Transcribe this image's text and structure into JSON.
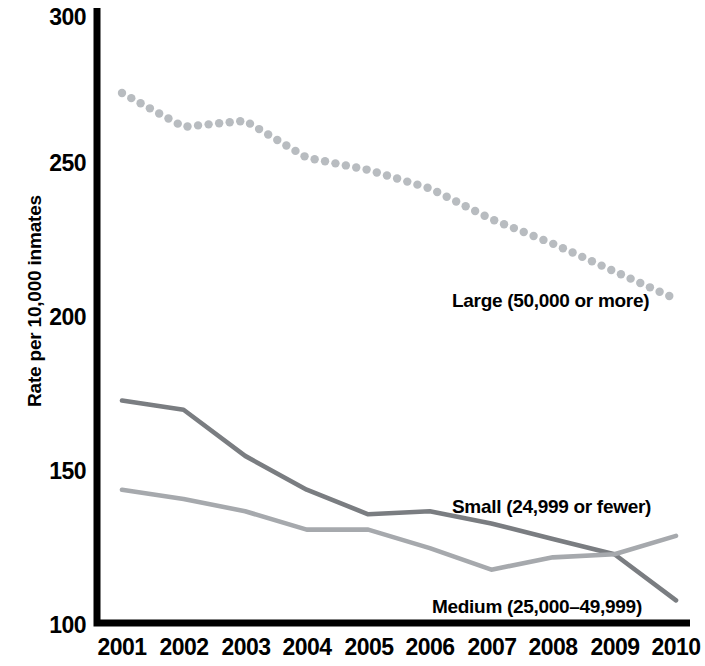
{
  "chart_data": {
    "type": "line",
    "title": "",
    "subtitle": "",
    "xlabel": "",
    "ylabel": "Rate per 10,000 inmates",
    "x": [
      2001,
      2002,
      2003,
      2004,
      2005,
      2006,
      2007,
      2008,
      2009,
      2010
    ],
    "categories": [
      "2001",
      "2002",
      "2003",
      "2004",
      "2005",
      "2006",
      "2007",
      "2008",
      "2009",
      "2010"
    ],
    "xlim": [
      2001,
      2010
    ],
    "ylim": [
      100,
      300
    ],
    "yticks": [
      100,
      150,
      200,
      250,
      300
    ],
    "ytick_labels": [
      "100",
      "150",
      "200",
      "250",
      "300"
    ],
    "grid": false,
    "legend_position": "inline-annotations",
    "series": [
      {
        "name": "Large (50,000 or more)",
        "style": "dotted",
        "color": "#b8bcc0",
        "values": [
          273,
          262,
          264,
          252,
          248,
          242,
          232,
          224,
          215,
          206
        ]
      },
      {
        "name": "Medium (25,000–49,999)",
        "style": "solid",
        "color": "#7a7d81",
        "values": [
          173,
          170,
          155,
          144,
          136,
          137,
          133,
          128,
          123,
          108
        ]
      },
      {
        "name": "Small (24,999 or fewer)",
        "style": "solid",
        "color": "#a6a9ad",
        "values": [
          144,
          141,
          137,
          131,
          131,
          125,
          118,
          122,
          123,
          129
        ]
      }
    ],
    "annotations": [
      {
        "text": "Large (50,000 or more)",
        "series": "Large (50,000 or more)"
      },
      {
        "text": "Small (24,999 or fewer)",
        "series": "Small (24,999 or fewer)"
      },
      {
        "text": "Medium (25,000–49,999)",
        "series": "Medium (25,000–49,999)"
      }
    ]
  },
  "axis": {
    "y_title": "Rate per 10,000 inmates",
    "y_ticks": [
      "300",
      "250",
      "200",
      "150",
      "100"
    ],
    "x_ticks": [
      "2001",
      "2002",
      "2003",
      "2004",
      "2005",
      "2006",
      "2007",
      "2008",
      "2009",
      "2010"
    ]
  },
  "labels": {
    "large": "Large (50,000 or more)",
    "small": "Small (24,999 or fewer)",
    "medium": "Medium (25,000–49,999)"
  },
  "colors": {
    "axis": "#000000",
    "large_series": "#b8bcc0",
    "medium_series": "#7a7d81",
    "small_series": "#a6a9ad",
    "background": "#ffffff"
  }
}
